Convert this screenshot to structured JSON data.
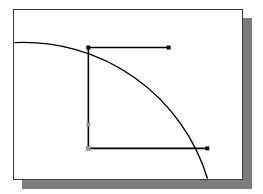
{
  "app": {
    "title": "CAD Drawing Canvas",
    "panel_label": "drawing-area"
  },
  "canvas": {
    "width": 263,
    "height": 194,
    "panel": {
      "x": 13,
      "y": 9,
      "width": 230,
      "height": 171,
      "background": "#ffffff",
      "border_color": "#3a3a3a",
      "shadow_color": "#7c7c7c",
      "shadow_offset_x": 9,
      "shadow_offset_y": 9
    }
  },
  "colors": {
    "stroke": "#000000",
    "grip": "#000000",
    "midpoint_marker": "#9a9a9a",
    "page_background": "#ffffff"
  },
  "shapes": {
    "arc": {
      "name": "quarter-circle-arc",
      "center_x": 14,
      "center_y": 180,
      "radius": 194,
      "start_x": 14,
      "start_y": 42,
      "apex_x": 90,
      "apex_y": 22,
      "end_x": 208,
      "end_y": 179,
      "stroke_width": 1.4
    },
    "polyline": {
      "name": "open-rectangle-polyline",
      "vertices": [
        {
          "id": "top-left",
          "x": 88,
          "y": 47
        },
        {
          "id": "top-right",
          "x": 169,
          "y": 47
        },
        {
          "id": "bottom-left",
          "x": 88,
          "y": 149
        },
        {
          "id": "bottom-right",
          "x": 208,
          "y": 149
        }
      ],
      "segments": [
        {
          "id": "top-horizontal-line",
          "x1": 88,
          "y1": 47,
          "x2": 169,
          "y2": 47
        },
        {
          "id": "left-vertical-line",
          "x1": 88,
          "y1": 47,
          "x2": 88,
          "y2": 149
        },
        {
          "id": "bottom-horizontal-line",
          "x1": 88,
          "y1": 149,
          "x2": 208,
          "y2": 149
        }
      ],
      "stroke_width": 1.6
    },
    "grips": [
      {
        "id": "grip-top-left",
        "x": 88,
        "y": 47,
        "size": 4,
        "color": "#000000"
      },
      {
        "id": "grip-top-right",
        "x": 169,
        "y": 47,
        "size": 4,
        "color": "#000000"
      },
      {
        "id": "grip-bottom-right",
        "x": 208,
        "y": 149,
        "size": 4,
        "color": "#000000"
      }
    ],
    "markers": [
      {
        "id": "marker-left-midpoint",
        "x": 88,
        "y": 125,
        "size": 4,
        "color": "#9a9a9a"
      },
      {
        "id": "marker-bottom-left-corner",
        "x": 88,
        "y": 149,
        "size": 5,
        "color": "#9a9a9a"
      }
    ]
  }
}
